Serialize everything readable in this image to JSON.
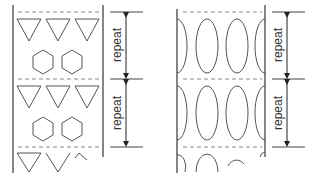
{
  "diagram": {
    "colors": {
      "stroke": "#555555",
      "dashed": "#888888",
      "text": "#333333"
    },
    "left_panel": {
      "motifs": [
        "triangle",
        "hexagon"
      ],
      "repeats": [
        {
          "label": "repeat"
        },
        {
          "label": "repeat"
        }
      ]
    },
    "right_panel": {
      "motifs": [
        "ellipse"
      ],
      "repeats": [
        {
          "label": "repeat"
        },
        {
          "label": "repeat"
        }
      ]
    }
  }
}
